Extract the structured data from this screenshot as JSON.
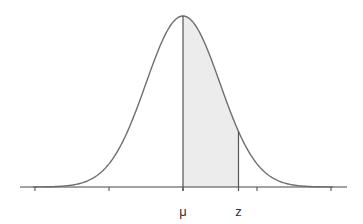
{
  "diagram": {
    "labels": {
      "mu": "μ",
      "z": "z"
    },
    "colors": {
      "curve": "#6e6e6e",
      "axis": "#444444",
      "shade": "#ececec",
      "verticals": "#555555"
    },
    "geometry": {
      "axis_y": 187,
      "axis_x_start": 20,
      "axis_x_end": 347,
      "mean_x": 183,
      "sigma_px": 37,
      "peak_height_px": 171,
      "z_value_sigma": 1.5,
      "tick_positions_sigma": [
        -4,
        -2,
        0,
        2,
        4
      ]
    }
  }
}
